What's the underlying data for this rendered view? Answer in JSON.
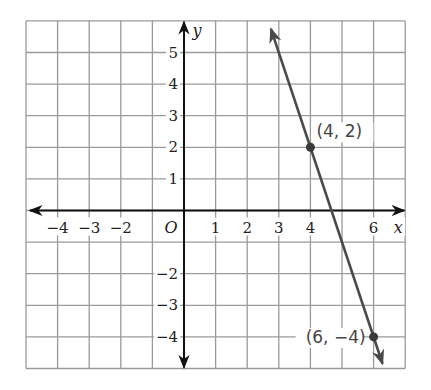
{
  "chart_data": {
    "type": "line",
    "title": "",
    "xlabel": "x",
    "ylabel": "y",
    "origin_label": "O",
    "xlim": [
      -5,
      7
    ],
    "ylim": [
      -5,
      6
    ],
    "grid": true,
    "x_ticks": [
      -4,
      -3,
      -2,
      1,
      2,
      3,
      4,
      6
    ],
    "x_tick_labels": [
      "−4",
      "−3",
      "−2",
      "1",
      "2",
      "3",
      "4",
      "6"
    ],
    "y_ticks": [
      5,
      4,
      3,
      2,
      1,
      -2,
      -3,
      -4
    ],
    "y_tick_labels": [
      "5",
      "4",
      "3",
      "2",
      "1",
      "−2",
      "−3",
      "−4"
    ],
    "series": [
      {
        "name": "line",
        "slope": -3,
        "intercept": 14,
        "x": [
          4,
          6
        ],
        "y": [
          2,
          -4
        ],
        "color": "#4a4a4a"
      }
    ],
    "points": [
      {
        "x": 4,
        "y": 2,
        "label": "(4, 2)"
      },
      {
        "x": 6,
        "y": -4,
        "label": "(6, −4)"
      }
    ]
  }
}
